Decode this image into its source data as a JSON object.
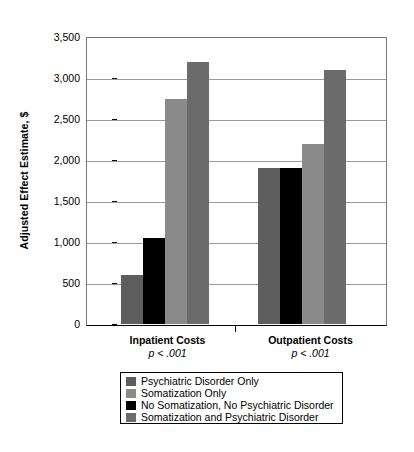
{
  "chart_data": {
    "type": "bar",
    "title": "",
    "xlabel": "",
    "ylabel": "Adjusted Effect Estimate, $",
    "ylim": [
      0,
      3500
    ],
    "yticks": [
      0,
      500,
      1000,
      1500,
      2000,
      2500,
      3000,
      3500
    ],
    "ytick_labels": [
      "0",
      "500",
      "1,000",
      "1,500",
      "2,000",
      "2,500",
      "3,000",
      "3,500"
    ],
    "grid": true,
    "legend_position": "below-axes",
    "categories": [
      "Inpatient Costs",
      "Outpatient Costs"
    ],
    "category_annotations": [
      "p < .001",
      "p < .001"
    ],
    "series": [
      {
        "name": "Psychiatric Disorder Only",
        "color": "#5e5e5e",
        "values": [
          600,
          1900
        ]
      },
      {
        "name": "No Somatization, No Psychiatric Disorder",
        "color": "#000000",
        "values": [
          1050,
          1900
        ]
      },
      {
        "name": "Somatization Only",
        "color": "#8a8a8a",
        "values": [
          2750,
          2200
        ]
      },
      {
        "name": "Somatization and Psychiatric Disorder",
        "color": "#6b6b6b",
        "values": [
          3200,
          3100
        ]
      }
    ],
    "legend_entries": [
      {
        "label": "Psychiatric Disorder Only",
        "color": "#5e5e5e"
      },
      {
        "label": "Somatization Only",
        "color": "#8a8a8a"
      },
      {
        "label": "No Somatization, No Psychiatric Disorder",
        "color": "#000000"
      },
      {
        "label": "Somatization and Psychiatric Disorder",
        "color": "#6b6b6b"
      }
    ]
  },
  "axis": {
    "y_title": "Adjusted Effect Estimate, $",
    "y_labels": [
      "3,500",
      "3,000",
      "2,500",
      "2,000",
      "1,500",
      "1,000",
      "500",
      "0"
    ]
  },
  "groups": [
    {
      "name": "Inpatient Costs",
      "pvalue": "p < .001"
    },
    {
      "name": "Outpatient Costs",
      "pvalue": "p < .001"
    }
  ],
  "legend": {
    "items": [
      {
        "label": "Psychiatric Disorder Only"
      },
      {
        "label": "Somatization Only"
      },
      {
        "label": "No Somatization, No Psychiatric Disorder"
      },
      {
        "label": "Somatization and Psychiatric Disorder"
      }
    ]
  }
}
